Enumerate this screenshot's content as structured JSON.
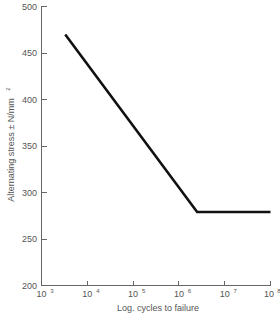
{
  "chart_data": {
    "type": "line",
    "title": "",
    "xlabel": "Log. cycles to failure",
    "ylabel": "Alternating stress ± N/mm²",
    "ylabel_text": "Alternating stress ± N/mm",
    "ylabel_superscript": "2",
    "xscale": "log",
    "yscale": "linear",
    "xlim": [
      1000,
      100000000
    ],
    "ylim": [
      200,
      500
    ],
    "grid": false,
    "legend": null,
    "xticks": [
      {
        "value": 1000,
        "base": "10",
        "exponent": "3",
        "label": "10^3"
      },
      {
        "value": 10000,
        "base": "10",
        "exponent": "4",
        "label": "10^4"
      },
      {
        "value": 100000,
        "base": "10",
        "exponent": "5",
        "label": "10^5"
      },
      {
        "value": 1000000,
        "base": "10",
        "exponent": "6",
        "label": "10^6"
      },
      {
        "value": 10000000,
        "base": "10",
        "exponent": "7",
        "label": "10^7"
      },
      {
        "value": 100000000,
        "base": "10",
        "exponent": "8",
        "label": "10^8"
      }
    ],
    "yticks": [
      {
        "value": 200,
        "label": "200"
      },
      {
        "value": 250,
        "label": "250"
      },
      {
        "value": 300,
        "label": "300"
      },
      {
        "value": 350,
        "label": "350"
      },
      {
        "value": 400,
        "label": "400"
      },
      {
        "value": 450,
        "label": "450"
      },
      {
        "value": 500,
        "label": "500"
      }
    ],
    "series": [
      {
        "name": "S-N curve",
        "color": "#111111",
        "points": [
          {
            "x": 3300,
            "y": 470
          },
          {
            "x": 2500000,
            "y": 279
          },
          {
            "x": 100000000,
            "y": 279
          }
        ]
      }
    ],
    "x": [
      3300,
      2500000,
      100000000
    ],
    "values": [
      470,
      279,
      279
    ]
  },
  "colors": {
    "line": "#111111",
    "axis": "#666666",
    "text": "#555555",
    "background": "#ffffff"
  }
}
